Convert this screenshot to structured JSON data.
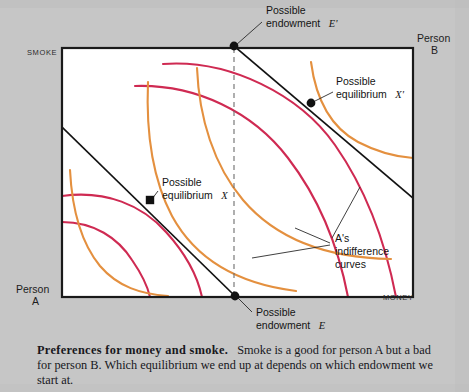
{
  "figure": {
    "axis_labels": {
      "y_axis": "SMOKE",
      "x_axis": "MONEY",
      "origin_a_line1": "Person",
      "origin_a_line2": "A",
      "origin_b_line1": "Person",
      "origin_b_line2": "B"
    },
    "annotations": {
      "endowment_prime_line1": "Possible",
      "endowment_prime_line2": "endowment",
      "endowment_prime_symbol": "E'",
      "equilibrium_prime_line1": "Possible",
      "equilibrium_prime_line2": "equilibrium",
      "equilibrium_prime_symbol": "X'",
      "equilibrium_line1": "Possible",
      "equilibrium_line2": "equilibrium",
      "equilibrium_symbol": "X",
      "endowment_line1": "Possible",
      "endowment_line2": "endowment",
      "endowment_symbol": "E",
      "indifference_line1": "A's",
      "indifference_line2": "indifference",
      "indifference_line3": "curves"
    },
    "colors": {
      "background": "#c6c6c6",
      "plot_area": "#ffffff",
      "box_border": "#1a1a1a",
      "person_a_curves": "#e4903f",
      "person_b_curves": "#cf2a52",
      "budget_line": "#121212",
      "dashed_line": "#6d6d6d",
      "marker": "#111111"
    }
  },
  "caption": {
    "title": "Preferences for money and smoke.",
    "body": "Smoke is a good for person A but a bad for person B. Which equilibrium we end up at depends on which endowment we start at."
  },
  "chart_data": {
    "type": "line",
    "title": "Preferences for money and smoke",
    "xlabel": "MONEY",
    "ylabel": "SMOKE",
    "grid": false,
    "legend": "none",
    "box": {
      "left": 62,
      "top": 48,
      "right": 413,
      "bottom": 297
    },
    "points": [
      {
        "name": "E'",
        "label": "Possible endowment E'",
        "x": 234,
        "y": 46
      },
      {
        "name": "X'",
        "label": "Possible equilibrium X'",
        "x": 311,
        "y": 103
      },
      {
        "name": "X",
        "label": "Possible equilibrium X",
        "x": 150,
        "y": 200
      },
      {
        "name": "E",
        "label": "Possible endowment E",
        "x": 235,
        "y": 296
      }
    ],
    "budget_lines": [
      {
        "name": "budget-through-E-prime",
        "from": [
          234,
          46
        ],
        "to": [
          413,
          198
        ]
      },
      {
        "name": "budget-through-E",
        "from": [
          62,
          127
        ],
        "to": [
          235,
          296
        ]
      }
    ],
    "dashed_line": {
      "name": "endowment-vertical",
      "x": 234,
      "from_y": 48,
      "to_y": 296
    },
    "series": [
      {
        "name": "B-indifference-1",
        "color": "#cf2a52",
        "path": "M 163 64 C 230 59, 300 95, 335 145 C 365 188, 385 240, 396 297"
      },
      {
        "name": "B-indifference-2",
        "color": "#cf2a52",
        "path": "M 135 86 C 196 84, 253 112, 288 158 C 318 197, 338 245, 348 297"
      },
      {
        "name": "B-indifference-3",
        "color": "#cf2a52",
        "path": "M 62 196 C 106 190, 142 205, 166 232 C 186 254, 197 274, 202 297"
      },
      {
        "name": "B-indifference-4",
        "color": "#cf2a52",
        "path": "M 62 222 C 94 222, 118 238, 132 260 C 143 276, 148 288, 150 297"
      },
      {
        "name": "A-indifference-1",
        "color": "#e4903f",
        "path": "M 148 82 C 146 130, 152 178, 172 216 C 196 260, 240 284, 296 291"
      },
      {
        "name": "A-indifference-2",
        "color": "#e4903f",
        "path": "M 197 68 C 199 118, 214 166, 243 200 C 278 241, 330 258, 391 259"
      },
      {
        "name": "A-indifference-3",
        "color": "#e4903f",
        "path": "M 311 62 C 316 100, 332 128, 358 142 C 381 154, 398 157, 413 158"
      },
      {
        "name": "A-indifference-4",
        "color": "#e4903f",
        "path": "M 70 170 C 72 210, 82 244, 100 266 C 118 287, 141 294, 168 296"
      }
    ],
    "leader_lines": [
      {
        "name": "leader-E-prime",
        "from": [
          236,
          45
        ],
        "to": [
          262,
          22
        ]
      },
      {
        "name": "leader-X-prime",
        "from": [
          313,
          102
        ],
        "to": [
          333,
          92
        ]
      },
      {
        "name": "leader-X",
        "from": [
          152,
          199
        ],
        "to": [
          158,
          191
        ]
      },
      {
        "name": "leader-E",
        "from": [
          237,
          297
        ],
        "to": [
          252,
          312
        ]
      },
      {
        "name": "leader-indiff-1",
        "from": [
          330,
          245
        ],
        "to": [
          252,
          258
        ]
      },
      {
        "name": "leader-indiff-2",
        "from": [
          330,
          243
        ],
        "to": [
          295,
          228
        ]
      },
      {
        "name": "leader-indiff-3",
        "from": [
          332,
          238
        ],
        "to": [
          360,
          187
        ]
      }
    ]
  }
}
